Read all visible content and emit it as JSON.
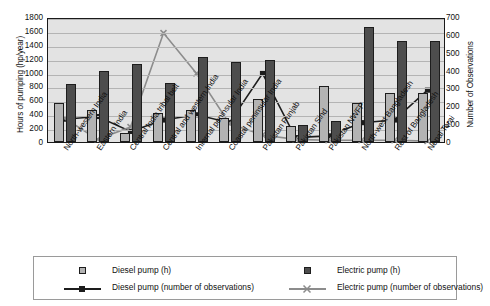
{
  "chart_data": {
    "type": "bar",
    "title": "",
    "subtitle": "",
    "xlabel": "",
    "ylabel": "Hours of pumping (hp/year)",
    "y2label": "Number of Observations",
    "ylim": [
      0,
      1800
    ],
    "y2lim": [
      0,
      700
    ],
    "yticks": [
      0,
      200,
      400,
      600,
      800,
      1000,
      1200,
      1400,
      1600,
      1800
    ],
    "y2ticks": [
      0,
      100,
      200,
      300,
      400,
      500,
      600,
      700
    ],
    "grid": true,
    "legend_position": "bottom",
    "categories": [
      "North-western India",
      "Eastern India",
      "Central India tribal belt",
      "Central and western India",
      "Internal peninsular India",
      "Coastal peninsular India",
      "Pakistan Punjab",
      "Pakistan Sind",
      "Pakistan NWFP",
      "North-west Bangladesh",
      "Rest of Bangladesh",
      "Nepal Terai"
    ],
    "series": [
      {
        "name": "Diesel pump (h)",
        "kind": "bar",
        "axis": "left",
        "color": "#b3b3b3",
        "values": [
          560,
          465,
          130,
          415,
          460,
          345,
          620,
          235,
          805,
          555,
          700,
          700
        ]
      },
      {
        "name": "Electric pump (h)",
        "kind": "bar",
        "axis": "left",
        "color": "#4d4d4d",
        "values": [
          835,
          1020,
          1130,
          850,
          1225,
          1150,
          1175,
          250,
          300,
          1650,
          1450,
          1450
        ]
      },
      {
        "name": "Diesel pump (number of observations)",
        "kind": "line",
        "axis": "right",
        "color": "#1d1d1d",
        "marker": "square",
        "values": [
          130,
          145,
          60,
          125,
          155,
          110,
          390,
          25,
          35,
          110,
          125,
          295
        ]
      },
      {
        "name": "Electric pump (number of observations)",
        "kind": "line",
        "axis": "right",
        "color": "#8c8c8c",
        "marker": "x",
        "values": [
          135,
          15,
          85,
          620,
          390,
          105,
          40,
          15,
          10,
          10,
          10,
          5
        ]
      }
    ]
  },
  "legend": {
    "items": [
      {
        "label": "Diesel pump (h)",
        "style": "swatch-light"
      },
      {
        "label": "Electric pump (h)",
        "style": "swatch-dark"
      },
      {
        "label": "Diesel pump (number of observations)",
        "style": "line-dark-square"
      },
      {
        "label": "Electric pump (number of observations)",
        "style": "line-grey-x"
      }
    ]
  },
  "colors": {
    "diesel_bar": "#b3b3b3",
    "electric_bar": "#4d4d4d",
    "diesel_line": "#1d1d1d",
    "electric_line": "#8c8c8c",
    "plot_background": "#e3e3e3",
    "gridline": "#b4b4b4",
    "axis": "#1a1a1a"
  }
}
